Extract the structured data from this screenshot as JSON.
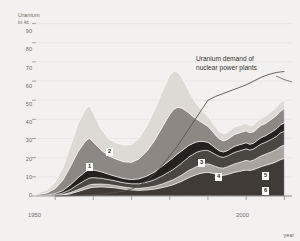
{
  "axes": {
    "y_title": "Uranium\nin kt",
    "x_title": "year",
    "y_ticks": [
      "90",
      "80",
      "70",
      "60",
      "50",
      "40",
      "30",
      "20",
      "10",
      "0"
    ],
    "x_ticks": [
      "1950",
      "2000"
    ]
  },
  "annotation": {
    "demand_line": "Uranium demand of\nnuclear power plants"
  },
  "band_labels": {
    "one": "1",
    "two": "2",
    "three": "3",
    "four": "4",
    "five": "5",
    "six": "6"
  },
  "colors": {
    "background": "#f2f1ef",
    "axis_text": "#6e6a66",
    "gridline": "#e3e1de",
    "annotation_text": "#37332f",
    "demand_line": "#55504b",
    "band_1": "#3a3633",
    "band_2": "#ddd9d4",
    "band_3": "#24211f",
    "band_4": "#4a4642",
    "band_5": "#a9a49e",
    "band_6": "#403b37"
  },
  "chart_data": {
    "type": "area",
    "title": "",
    "subtitle": "",
    "xlabel": "year",
    "ylabel": "Uranium in kt",
    "xlim": [
      1945,
      2012
    ],
    "ylim": [
      0,
      95
    ],
    "grid": true,
    "stacked": true,
    "legend": "none",
    "x": [
      1945,
      1948,
      1950,
      1952,
      1954,
      1956,
      1958,
      1959,
      1960,
      1962,
      1964,
      1966,
      1968,
      1970,
      1972,
      1974,
      1976,
      1978,
      1980,
      1981,
      1982,
      1983,
      1984,
      1985,
      1986,
      1987,
      1988,
      1989,
      1990,
      1991,
      1992,
      1993,
      1994,
      1995,
      1996,
      1997,
      1998,
      1999,
      2000,
      2001,
      2002,
      2003,
      2004,
      2005,
      2006,
      2007,
      2008,
      2009,
      2010
    ],
    "series": [
      {
        "name": "band-6-bottom",
        "label": "6",
        "color": "#403b37",
        "values": [
          0,
          0,
          0.2,
          0.5,
          1.2,
          2.4,
          3.6,
          4.2,
          4.6,
          4.8,
          4.6,
          4.2,
          3.6,
          3.2,
          3.0,
          3.2,
          3.6,
          4.4,
          5.4,
          6.0,
          6.8,
          7.6,
          8.6,
          9.6,
          10.4,
          11.2,
          11.8,
          12.2,
          12.4,
          12.0,
          11.4,
          11.0,
          10.8,
          11.2,
          11.8,
          12.4,
          12.8,
          13.2,
          13.6,
          13.4,
          13.8,
          14.6,
          15.4,
          16.0,
          16.6,
          17.2,
          18.0,
          19.0,
          19.6
        ]
      },
      {
        "name": "band-5",
        "label": "5",
        "color": "#a9a49e",
        "values": [
          0,
          0,
          0.1,
          0.3,
          0.6,
          1.0,
          1.4,
          1.6,
          1.6,
          1.5,
          1.4,
          1.2,
          1.1,
          1.0,
          1.0,
          1.2,
          1.5,
          1.9,
          2.4,
          2.6,
          2.9,
          3.2,
          3.5,
          3.8,
          4.0,
          4.2,
          4.3,
          4.4,
          4.4,
          4.2,
          4.0,
          3.8,
          3.8,
          4.0,
          4.2,
          4.4,
          4.6,
          4.8,
          5.0,
          4.8,
          5.0,
          5.4,
          5.6,
          5.8,
          6.0,
          6.2,
          6.4,
          6.8,
          7.0
        ]
      },
      {
        "name": "band-4",
        "label": "4",
        "color": "#4a4642",
        "values": [
          0.1,
          0.2,
          0.4,
          0.8,
          1.6,
          2.6,
          3.4,
          3.6,
          3.4,
          3.0,
          2.6,
          2.4,
          2.2,
          2.2,
          2.4,
          2.8,
          3.4,
          4.2,
          5.0,
          5.4,
          5.8,
          6.2,
          6.6,
          7.0,
          7.2,
          7.4,
          7.4,
          7.2,
          7.0,
          6.6,
          6.2,
          5.8,
          5.6,
          5.6,
          5.8,
          6.0,
          6.0,
          6.0,
          6.0,
          5.8,
          5.8,
          6.0,
          6.2,
          6.2,
          6.4,
          6.6,
          6.8,
          7.2,
          7.2
        ]
      },
      {
        "name": "band-3",
        "label": "3",
        "color": "#24211f",
        "values": [
          0.1,
          0.3,
          0.6,
          1.2,
          2.4,
          3.6,
          4.4,
          4.4,
          4.0,
          3.4,
          2.8,
          2.4,
          2.2,
          2.2,
          2.6,
          3.2,
          4.0,
          5.0,
          5.8,
          6.2,
          6.4,
          6.4,
          6.2,
          6.0,
          5.8,
          5.4,
          5.0,
          4.6,
          4.2,
          3.8,
          3.4,
          3.0,
          2.8,
          2.8,
          3.0,
          3.2,
          3.2,
          3.2,
          3.2,
          3.0,
          3.0,
          3.2,
          3.4,
          3.4,
          3.6,
          3.8,
          4.0,
          4.2,
          4.4
        ]
      },
      {
        "name": "mid-bands",
        "label": "",
        "color": "#8d8883",
        "values": [
          0.4,
          1.2,
          2.6,
          5.4,
          9.6,
          13.6,
          16.0,
          16.4,
          14.6,
          11.4,
          9.6,
          9.0,
          8.8,
          9.0,
          10.4,
          13.0,
          16.4,
          20.4,
          24.0,
          25.0,
          24.4,
          22.6,
          20.0,
          17.0,
          14.2,
          12.0,
          10.4,
          9.2,
          8.4,
          7.6,
          6.8,
          6.2,
          5.8,
          5.8,
          6.0,
          6.2,
          6.2,
          6.2,
          6.2,
          6.0,
          6.0,
          6.2,
          6.4,
          6.4,
          6.6,
          6.8,
          7.0,
          7.2,
          7.4
        ]
      },
      {
        "name": "band-2",
        "label": "2",
        "color": "#ddd9d4",
        "values": [
          0.6,
          1.6,
          3.2,
          6.2,
          10.4,
          14.4,
          16.6,
          16.8,
          14.8,
          11.0,
          8.8,
          8.4,
          8.6,
          9.2,
          10.8,
          13.2,
          15.8,
          18.4,
          20.2,
          20.0,
          18.4,
          16.2,
          13.8,
          11.4,
          9.4,
          7.8,
          6.6,
          5.8,
          5.2,
          4.6,
          4.2,
          3.8,
          3.6,
          3.6,
          3.8,
          3.8,
          3.8,
          3.8,
          3.8,
          3.6,
          3.6,
          3.8,
          3.8,
          3.8,
          4.0,
          4.0,
          4.2,
          4.4,
          4.4
        ]
      }
    ],
    "totals": [
      1.2,
      3.3,
      7.1,
      14.4,
      25.8,
      37.6,
      45.4,
      47.0,
      43.0,
      35.1,
      29.8,
      27.6,
      26.5,
      26.8,
      30.2,
      36.6,
      44.7,
      54.3,
      62.8,
      65.2,
      64.7,
      62.2,
      58.7,
      54.8,
      51.0,
      48.0,
      45.5,
      43.4,
      41.6,
      38.8,
      36.0,
      33.6,
      32.4,
      33.0,
      34.6,
      36.0,
      36.6,
      37.2,
      37.8,
      36.6,
      37.2,
      39.2,
      40.8,
      41.6,
      43.2,
      44.6,
      46.4,
      48.8,
      50.0
    ],
    "overlay_line": {
      "name": "Uranium demand of nuclear power plants",
      "color": "#55504b",
      "x": [
        1950,
        1955,
        1960,
        1965,
        1968,
        1970,
        1972,
        1974,
        1976,
        1978,
        1980,
        1982,
        1984,
        1986,
        1988,
        1990,
        1992,
        1994,
        1996,
        1998,
        2000,
        2002,
        2004,
        2006,
        2008,
        2010
      ],
      "values": [
        0,
        0.2,
        0.6,
        1.6,
        2.6,
        3.6,
        5.4,
        8.0,
        11.6,
        16.0,
        21.0,
        26.0,
        32.0,
        38.0,
        44.0,
        50.0,
        52.0,
        53.5,
        55.0,
        56.5,
        58.0,
        60.0,
        62.0,
        63.5,
        64.5,
        65.0
      ]
    },
    "peak": {
      "year": 1981,
      "value": 72
    },
    "first_peak": {
      "year": 1959,
      "value": 47
    }
  }
}
